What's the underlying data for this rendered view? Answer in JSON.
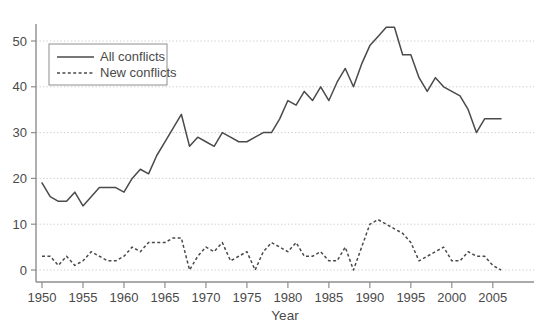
{
  "chart_data": {
    "type": "line",
    "title": "",
    "subtitle": "",
    "xlabel": "Year",
    "ylabel": "",
    "xlim": [
      1949,
      2007
    ],
    "ylim": [
      -2,
      55
    ],
    "grid": true,
    "grid_axis": "y",
    "legend_position": "top-left",
    "x_ticks": [
      1950,
      1955,
      1960,
      1965,
      1970,
      1975,
      1980,
      1985,
      1990,
      1995,
      2000,
      2005
    ],
    "y_ticks": [
      0,
      10,
      20,
      30,
      40,
      50
    ],
    "x": [
      1950,
      1951,
      1952,
      1953,
      1954,
      1955,
      1956,
      1957,
      1958,
      1959,
      1960,
      1961,
      1962,
      1963,
      1964,
      1965,
      1966,
      1967,
      1968,
      1969,
      1970,
      1971,
      1972,
      1973,
      1974,
      1975,
      1976,
      1977,
      1978,
      1979,
      1980,
      1981,
      1982,
      1983,
      1984,
      1985,
      1986,
      1987,
      1988,
      1989,
      1990,
      1991,
      1992,
      1993,
      1994,
      1995,
      1996,
      1997,
      1998,
      1999,
      2000,
      2001,
      2002,
      2003,
      2004,
      2005,
      2006
    ],
    "series": [
      {
        "name": "All conflicts",
        "style": "solid",
        "color": "#4a4a4a",
        "values": [
          19,
          16,
          15,
          15,
          17,
          14,
          16,
          18,
          18,
          18,
          17,
          20,
          22,
          21,
          25,
          28,
          31,
          34,
          27,
          29,
          28,
          27,
          30,
          29,
          28,
          28,
          29,
          30,
          30,
          33,
          37,
          36,
          39,
          37,
          40,
          37,
          41,
          44,
          40,
          45,
          49,
          51,
          53,
          53,
          47,
          47,
          42,
          39,
          42,
          40,
          39,
          38,
          35,
          30,
          33,
          33,
          33
        ]
      },
      {
        "name": "New conflicts",
        "style": "dashed",
        "color": "#4a4a4a",
        "values": [
          3,
          3,
          1,
          3,
          1,
          2,
          4,
          3,
          2,
          2,
          3,
          5,
          4,
          6,
          6,
          6,
          7,
          7,
          0,
          3,
          5,
          4,
          6,
          2,
          3,
          4,
          0,
          4,
          6,
          5,
          4,
          6,
          3,
          3,
          4,
          2,
          2,
          5,
          0,
          5,
          10,
          11,
          10,
          9,
          8,
          6,
          2,
          3,
          4,
          5,
          2,
          2,
          4,
          3,
          3,
          1,
          0
        ]
      }
    ]
  },
  "legend": {
    "items": [
      {
        "label": "All conflicts",
        "style": "solid"
      },
      {
        "label": "New conflicts",
        "style": "dashed"
      }
    ]
  },
  "axes": {
    "x_title": "Year",
    "x_tick_labels": [
      "1950",
      "1955",
      "1960",
      "1965",
      "1970",
      "1975",
      "1980",
      "1985",
      "1990",
      "1995",
      "2000",
      "2005"
    ],
    "y_tick_labels": [
      "0",
      "10",
      "20",
      "30",
      "40",
      "50"
    ]
  },
  "colors": {
    "background": "#ffffff",
    "line": "#4a4a4a",
    "grid": "#c9c9c9",
    "axis": "#8e8e8e",
    "text": "#4a4a4a"
  }
}
